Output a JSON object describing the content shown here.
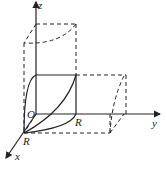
{
  "diagram": {
    "type": "3d-coordinate-figure",
    "axes": {
      "x": "x",
      "y": "y",
      "z": "z"
    },
    "origin_label": "O",
    "radius_labels": [
      "R",
      "R"
    ],
    "colors": {
      "line": "#222222",
      "background": "#ffffff"
    }
  }
}
